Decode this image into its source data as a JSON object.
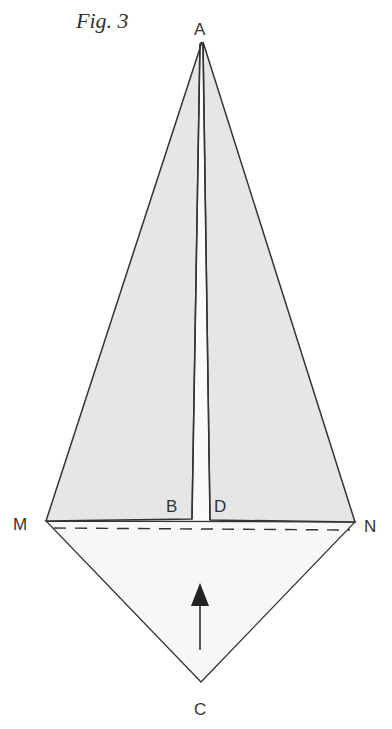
{
  "figure": {
    "title": "Fig. 3",
    "labels": {
      "A": "A",
      "B": "B",
      "C": "C",
      "D": "D",
      "M": "M",
      "N": "N"
    }
  },
  "colors": {
    "upper_fill": "#e6e6e6",
    "lower_fill": "#f7f7f7",
    "stroke": "#333333"
  }
}
